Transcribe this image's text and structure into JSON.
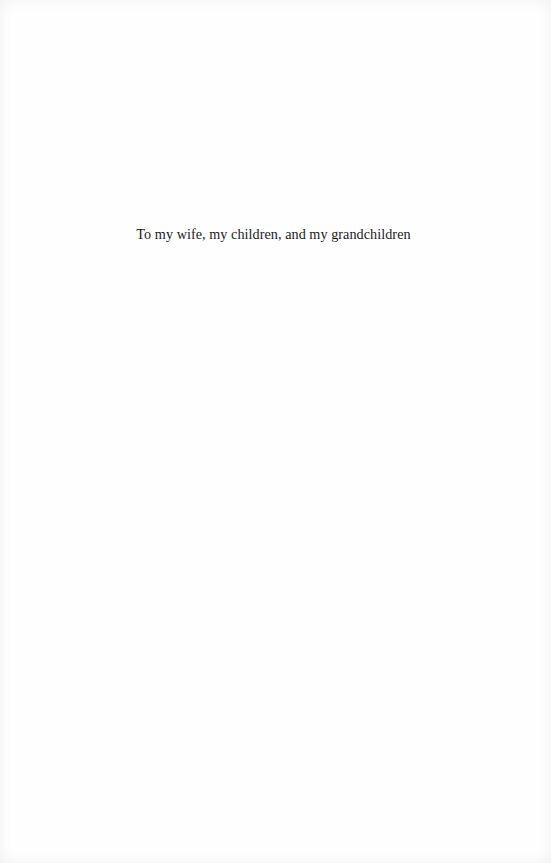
{
  "page": {
    "dedication": "To my wife, my children, and my grandchildren"
  }
}
